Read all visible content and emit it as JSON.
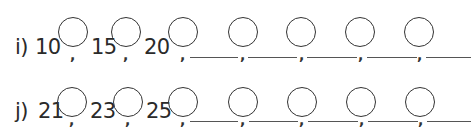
{
  "worksheet": {
    "rows": [
      {
        "label": "i)",
        "given": [
          "10",
          "15",
          "20"
        ],
        "circles": 7,
        "blanks": 5,
        "separator": ","
      },
      {
        "label": "j)",
        "given": [
          "21",
          "23",
          "25"
        ],
        "circles": 7,
        "blanks": 5,
        "separator": ","
      }
    ]
  }
}
